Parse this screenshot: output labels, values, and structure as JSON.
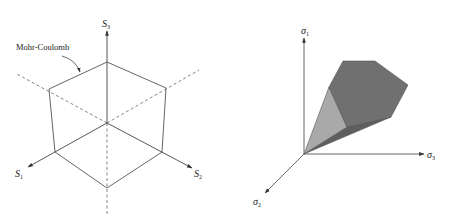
{
  "left_figure": {
    "annotation": "Mohr-Coulomb",
    "axes": {
      "s1": {
        "symbol": "S",
        "subscript": "1"
      },
      "s2": {
        "symbol": "S",
        "subscript": "2"
      },
      "s3": {
        "symbol": "S",
        "subscript": "3"
      }
    },
    "colors": {
      "line": "#555555"
    }
  },
  "right_figure": {
    "axes": {
      "sigma1": {
        "symbol": "σ",
        "subscript": "1"
      },
      "sigma2": {
        "symbol": "σ",
        "subscript": "2"
      },
      "sigma3": {
        "symbol": "σ",
        "subscript": "3"
      }
    },
    "colors": {
      "dark_face": "#6f6f6f",
      "light_face": "#a8a8a8",
      "bottom_face": "#5a5a5a",
      "edge": "#555555",
      "axis": "#555555"
    }
  }
}
